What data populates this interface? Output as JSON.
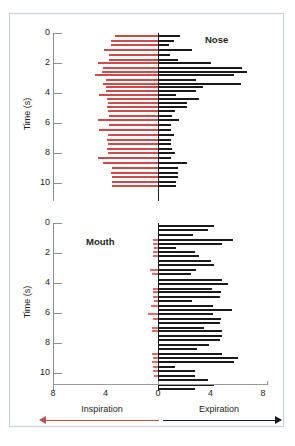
{
  "figure": {
    "y_axis_title": "Time (s)",
    "y_ticks": [
      0,
      2,
      4,
      6,
      8,
      10
    ],
    "x_ticks": [
      {
        "label": "8",
        "value": -8
      },
      {
        "label": "4",
        "value": -4
      },
      {
        "label": "0",
        "value": 0
      },
      {
        "label": "4",
        "value": 4
      },
      {
        "label": "8",
        "value": 8
      }
    ],
    "legend": {
      "inspiration_label": "Inspiration",
      "expiration_label": "Expiration",
      "inspiration_color": "#c0504d",
      "expiration_color": "#1a1a1a"
    },
    "panels": [
      {
        "key": "nose",
        "label": "Nose"
      },
      {
        "key": "mouth",
        "label": "Mouth"
      }
    ]
  },
  "chart_data": [
    {
      "type": "bar",
      "title": "Nose",
      "orientation": "horizontal",
      "xlabel": "Inspiration / Expiration (L/s)",
      "ylabel": "Time (s)",
      "xlim": [
        -8,
        8
      ],
      "ylim": [
        0,
        11
      ],
      "y_ticks": [
        0,
        2,
        4,
        6,
        8,
        10
      ],
      "x_ticks": [
        -8,
        -4,
        0,
        4,
        8
      ],
      "grid": false,
      "legend_position": "bottom",
      "series": [
        {
          "name": "Inspiration",
          "color": "#d04a4a",
          "direction": "negative",
          "points": [
            {
              "t": 0.1,
              "v": -3.3
            },
            {
              "t": 0.45,
              "v": -3.6
            },
            {
              "t": 0.75,
              "v": -3.6
            },
            {
              "t": 1.05,
              "v": -4.1
            },
            {
              "t": 1.4,
              "v": -3.7
            },
            {
              "t": 1.75,
              "v": -3.7
            },
            {
              "t": 1.95,
              "v": -4.6
            },
            {
              "t": 2.25,
              "v": -4.2
            },
            {
              "t": 2.55,
              "v": -4.3
            },
            {
              "t": 2.75,
              "v": -4.8
            },
            {
              "t": 3.05,
              "v": -4.0
            },
            {
              "t": 3.3,
              "v": -4.2
            },
            {
              "t": 3.55,
              "v": -4.0
            },
            {
              "t": 3.8,
              "v": -4.0
            },
            {
              "t": 4.05,
              "v": -4.5
            },
            {
              "t": 4.3,
              "v": -3.9
            },
            {
              "t": 4.6,
              "v": -3.8
            },
            {
              "t": 4.85,
              "v": -3.9
            },
            {
              "t": 5.15,
              "v": -3.8
            },
            {
              "t": 5.45,
              "v": -3.7
            },
            {
              "t": 5.75,
              "v": -4.6
            },
            {
              "t": 6.05,
              "v": -3.7
            },
            {
              "t": 6.4,
              "v": -4.5
            },
            {
              "t": 6.75,
              "v": -3.8
            },
            {
              "t": 7.05,
              "v": -3.9
            },
            {
              "t": 7.35,
              "v": -3.8
            },
            {
              "t": 7.65,
              "v": -3.9
            },
            {
              "t": 7.95,
              "v": -3.8
            },
            {
              "t": 8.25,
              "v": -4.6
            },
            {
              "t": 8.6,
              "v": -4.2
            },
            {
              "t": 8.95,
              "v": -3.5
            },
            {
              "t": 9.25,
              "v": -3.6
            },
            {
              "t": 9.55,
              "v": -3.5
            },
            {
              "t": 9.85,
              "v": -3.5
            },
            {
              "t": 10.15,
              "v": -3.5
            }
          ]
        },
        {
          "name": "Expiration",
          "color": "#1a1a1a",
          "direction": "positive",
          "points": [
            {
              "t": 0.1,
              "v": 1.7
            },
            {
              "t": 0.45,
              "v": 1.2
            },
            {
              "t": 0.75,
              "v": 0.8
            },
            {
              "t": 1.05,
              "v": 2.6
            },
            {
              "t": 1.4,
              "v": 0.9
            },
            {
              "t": 1.75,
              "v": 1.5
            },
            {
              "t": 1.95,
              "v": 4.0
            },
            {
              "t": 2.25,
              "v": 6.4
            },
            {
              "t": 2.55,
              "v": 6.8
            },
            {
              "t": 2.75,
              "v": 5.8
            },
            {
              "t": 3.05,
              "v": 2.9
            },
            {
              "t": 3.3,
              "v": 6.3
            },
            {
              "t": 3.55,
              "v": 3.4
            },
            {
              "t": 3.8,
              "v": 2.9
            },
            {
              "t": 4.05,
              "v": 1.4
            },
            {
              "t": 4.3,
              "v": 3.1
            },
            {
              "t": 4.6,
              "v": 2.2
            },
            {
              "t": 4.85,
              "v": 2.2
            },
            {
              "t": 5.15,
              "v": 1.3
            },
            {
              "t": 5.45,
              "v": 1.1
            },
            {
              "t": 5.75,
              "v": 1.6
            },
            {
              "t": 6.05,
              "v": 1.0
            },
            {
              "t": 6.4,
              "v": 1.0
            },
            {
              "t": 6.75,
              "v": 1.2
            },
            {
              "t": 7.05,
              "v": 1.0
            },
            {
              "t": 7.35,
              "v": 1.0
            },
            {
              "t": 7.65,
              "v": 1.1
            },
            {
              "t": 7.95,
              "v": 1.3
            },
            {
              "t": 8.25,
              "v": 1.0
            },
            {
              "t": 8.6,
              "v": 2.2
            },
            {
              "t": 8.95,
              "v": 1.5
            },
            {
              "t": 9.25,
              "v": 1.5
            },
            {
              "t": 9.55,
              "v": 1.5
            },
            {
              "t": 9.85,
              "v": 1.4
            },
            {
              "t": 10.15,
              "v": 1.4
            }
          ]
        }
      ]
    },
    {
      "type": "bar",
      "title": "Mouth",
      "orientation": "horizontal",
      "xlabel": "Inspiration / Expiration (L/s)",
      "ylabel": "Time (s)",
      "xlim": [
        -8,
        8
      ],
      "ylim": [
        0,
        11
      ],
      "y_ticks": [
        0,
        2,
        4,
        6,
        8,
        10
      ],
      "x_ticks": [
        -8,
        -4,
        0,
        4,
        8
      ],
      "grid": false,
      "legend_position": "bottom",
      "series": [
        {
          "name": "Inspiration",
          "color": "#e06b6b",
          "direction": "negative",
          "points": [
            {
              "t": 0.1,
              "v": 0.0
            },
            {
              "t": 0.4,
              "v": 0.0
            },
            {
              "t": 0.7,
              "v": 0.0
            },
            {
              "t": 1.05,
              "v": -0.4
            },
            {
              "t": 1.35,
              "v": -0.35
            },
            {
              "t": 1.6,
              "v": -0.3
            },
            {
              "t": 1.85,
              "v": -0.4
            },
            {
              "t": 2.15,
              "v": -0.35
            },
            {
              "t": 2.45,
              "v": 0.0
            },
            {
              "t": 2.75,
              "v": 0.0
            },
            {
              "t": 3.05,
              "v": -0.6
            },
            {
              "t": 3.35,
              "v": -0.45
            },
            {
              "t": 3.7,
              "v": 0.0
            },
            {
              "t": 4.0,
              "v": 0.0
            },
            {
              "t": 4.3,
              "v": -0.35
            },
            {
              "t": 4.55,
              "v": -0.35
            },
            {
              "t": 4.85,
              "v": -0.35
            },
            {
              "t": 5.15,
              "v": -0.3
            },
            {
              "t": 5.45,
              "v": -0.55
            },
            {
              "t": 5.75,
              "v": 0.0
            },
            {
              "t": 6.0,
              "v": -0.75
            },
            {
              "t": 6.3,
              "v": -0.35
            },
            {
              "t": 6.6,
              "v": 0.0
            },
            {
              "t": 6.9,
              "v": -0.45
            },
            {
              "t": 7.15,
              "v": -0.45
            },
            {
              "t": 7.45,
              "v": 0.0
            },
            {
              "t": 7.75,
              "v": 0.0
            },
            {
              "t": 8.05,
              "v": 0.0
            },
            {
              "t": 8.35,
              "v": 0.0
            },
            {
              "t": 8.65,
              "v": -0.45
            },
            {
              "t": 8.9,
              "v": -0.35
            },
            {
              "t": 9.2,
              "v": -0.45
            },
            {
              "t": 9.5,
              "v": -0.4
            },
            {
              "t": 9.8,
              "v": -0.35
            },
            {
              "t": 10.1,
              "v": -0.3
            },
            {
              "t": 10.4,
              "v": 0.0
            }
          ]
        },
        {
          "name": "Expiration",
          "color": "#1a1a1a",
          "direction": "positive",
          "points": [
            {
              "t": 0.1,
              "v": 4.3
            },
            {
              "t": 0.4,
              "v": 3.8
            },
            {
              "t": 0.7,
              "v": 2.7
            },
            {
              "t": 1.05,
              "v": 5.7
            },
            {
              "t": 1.35,
              "v": 4.9
            },
            {
              "t": 1.6,
              "v": 1.4
            },
            {
              "t": 1.85,
              "v": 2.8
            },
            {
              "t": 2.15,
              "v": 3.1
            },
            {
              "t": 2.45,
              "v": 4.0
            },
            {
              "t": 2.75,
              "v": 4.3
            },
            {
              "t": 3.05,
              "v": 2.9
            },
            {
              "t": 3.35,
              "v": 2.5
            },
            {
              "t": 3.7,
              "v": 4.9
            },
            {
              "t": 4.0,
              "v": 5.3
            },
            {
              "t": 4.3,
              "v": 4.1
            },
            {
              "t": 4.55,
              "v": 4.8
            },
            {
              "t": 4.85,
              "v": 4.7
            },
            {
              "t": 5.15,
              "v": 2.6
            },
            {
              "t": 5.45,
              "v": 4.2
            },
            {
              "t": 5.75,
              "v": 5.6
            },
            {
              "t": 6.0,
              "v": 4.2
            },
            {
              "t": 6.3,
              "v": 4.8
            },
            {
              "t": 6.6,
              "v": 4.7
            },
            {
              "t": 6.9,
              "v": 3.5
            },
            {
              "t": 7.15,
              "v": 4.9
            },
            {
              "t": 7.45,
              "v": 4.9
            },
            {
              "t": 7.75,
              "v": 4.7
            },
            {
              "t": 8.05,
              "v": 3.9
            },
            {
              "t": 8.35,
              "v": 3.0
            },
            {
              "t": 8.65,
              "v": 4.9
            },
            {
              "t": 8.9,
              "v": 6.1
            },
            {
              "t": 9.2,
              "v": 5.8
            },
            {
              "t": 9.5,
              "v": 1.3
            },
            {
              "t": 9.8,
              "v": 2.8
            },
            {
              "t": 10.1,
              "v": 2.8
            },
            {
              "t": 10.4,
              "v": 3.8
            },
            {
              "t": 10.7,
              "v": 4.3
            },
            {
              "t": 11.0,
              "v": 2.8
            }
          ]
        }
      ]
    }
  ]
}
